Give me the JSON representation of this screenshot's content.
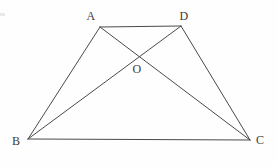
{
  "figure": {
    "canvas": {
      "width": 277,
      "height": 166
    },
    "background_color": "#fefefe",
    "line_color": "#4a4a4a",
    "label_color": "#3c3c3c",
    "stroke_width": 1,
    "points": {
      "A": {
        "label": "A",
        "x": 100,
        "y": 27,
        "label_x": 91,
        "label_y": 16
      },
      "D": {
        "label": "D",
        "x": 181,
        "y": 26,
        "label_x": 184,
        "label_y": 16
      },
      "B": {
        "label": "B",
        "x": 28,
        "y": 139,
        "label_x": 16,
        "label_y": 141
      },
      "C": {
        "label": "C",
        "x": 250,
        "y": 140,
        "label_x": 260,
        "label_y": 140
      },
      "O": {
        "label": "O",
        "x": 137,
        "y": 56,
        "label_x": 137,
        "label_y": 69
      }
    },
    "segments": [
      {
        "name": "AD",
        "from": "A",
        "to": "D",
        "role": "top-side"
      },
      {
        "name": "AB",
        "from": "A",
        "to": "B",
        "role": "left-side"
      },
      {
        "name": "DC",
        "from": "D",
        "to": "C",
        "role": "right-side"
      },
      {
        "name": "BC",
        "from": "B",
        "to": "C",
        "role": "bottom-side"
      },
      {
        "name": "AC",
        "from": "A",
        "to": "C",
        "role": "diagonal"
      },
      {
        "name": "BD",
        "from": "B",
        "to": "D",
        "role": "diagonal"
      }
    ]
  }
}
